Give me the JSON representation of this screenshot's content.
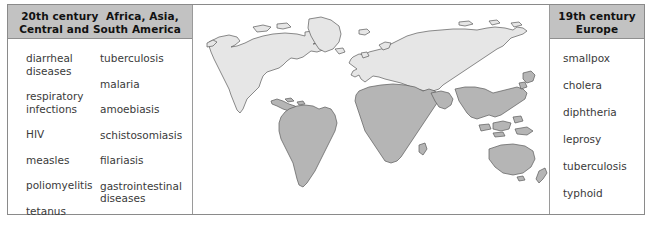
{
  "figure": {
    "panels": {
      "left": {
        "header_lines": [
          "20th century  Africa, Asia,",
          "Central and South America"
        ],
        "columns": [
          {
            "name": "column-one",
            "items": [
              "diarrheal\ndiseases",
              "respiratory\ninfections",
              "HIV",
              "measles",
              "poliomyelitis",
              "tetanus"
            ]
          },
          {
            "name": "column-two",
            "items": [
              "tuberculosis",
              "malaria",
              "amoebiasis",
              "schistosomiasis",
              "filariasis",
              "gastrointestinal\ndiseases"
            ]
          }
        ]
      },
      "right": {
        "header_lines": [
          "19th century",
          "Europe"
        ],
        "columns": [
          {
            "name": "column-one",
            "items": [
              "smallpox",
              "cholera",
              "diphtheria",
              "leprosy",
              "tuberculosis",
              "typhoid"
            ]
          }
        ]
      },
      "map": {
        "label": "world-map",
        "regions_light": [
          "North America",
          "Greenland",
          "Europe",
          "Northern Asia / Russia"
        ],
        "regions_dark": [
          "Central and South America",
          "Africa",
          "South and Southeast Asia",
          "Australia"
        ],
        "colors": {
          "light_fill": "#e6e6e6",
          "dark_fill": "#b5b5b5",
          "outline": "#5a5a5a",
          "ocean": "#ffffff"
        }
      }
    },
    "colors": {
      "header_bg": "#c2c2c2",
      "border": "#8a8a8a",
      "text": "#3a3a3a",
      "header_text": "#111111"
    }
  }
}
